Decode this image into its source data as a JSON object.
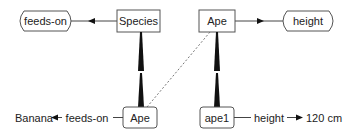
{
  "diagram": {
    "nodes": {
      "feeds_on_type": {
        "label": "feeds-on",
        "shape": "hexagon"
      },
      "species": {
        "label": "Species",
        "shape": "box"
      },
      "ape_class": {
        "label": "Ape",
        "shape": "box"
      },
      "height_type": {
        "label": "height",
        "shape": "hexagon"
      },
      "ape_instance_of_species": {
        "label": "Ape",
        "shape": "rounded-box"
      },
      "ape1": {
        "label": "ape1",
        "shape": "rounded-box"
      },
      "banana": {
        "label": "Banana",
        "shape": "plain-text"
      },
      "height_value": {
        "label": "120 cm",
        "shape": "plain-text"
      }
    },
    "edges": {
      "species_feeds_on": {
        "from": "Species",
        "to": "feeds-on",
        "style": "arrow-mid"
      },
      "ape_height": {
        "from": "Ape",
        "to": "height",
        "style": "arrow-mid"
      },
      "species_to_ape": {
        "from": "Species",
        "to": "Ape",
        "style": "instance-wedge"
      },
      "ape_class_to_ape1": {
        "from": "Ape",
        "to": "ape1",
        "style": "instance-wedge"
      },
      "ape_to_ape_dashed": {
        "from": "Ape",
        "to": "Ape",
        "style": "dashed"
      },
      "ape_feeds_on_banana": {
        "from": "Ape",
        "to": "Banana",
        "label": "feeds-on",
        "style": "arrow"
      },
      "ape1_height_value": {
        "from": "ape1",
        "to": "120 cm",
        "label": "height",
        "style": "arrow"
      }
    }
  }
}
